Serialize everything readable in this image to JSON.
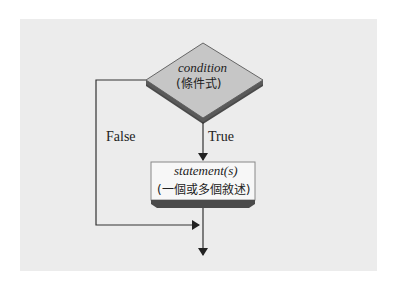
{
  "diagram": {
    "type": "flowchart",
    "decision": {
      "label": "condition",
      "sublabel": "(條件式)"
    },
    "process": {
      "label": "statement(s)",
      "sublabel": "(一個或多個敘述)"
    },
    "edges": {
      "true_label": "True",
      "false_label": "False"
    },
    "colors": {
      "background": "#ececec",
      "shape_fill": "#f5f5f5",
      "diamond_fill": "#c4c4c4",
      "shadow": "#555555",
      "line": "#333333"
    }
  }
}
